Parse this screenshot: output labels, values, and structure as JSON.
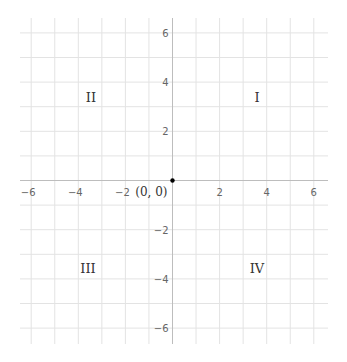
{
  "diagram": {
    "type": "cartesian-coordinate-plane",
    "x_range": [
      -6,
      6
    ],
    "y_range": [
      -6,
      6
    ],
    "grid_step": 1,
    "label_step": 2,
    "x_tick_labels": [
      "−6",
      "−4",
      "−2",
      "2",
      "4",
      "6"
    ],
    "x_tick_values": [
      -6,
      -4,
      -2,
      2,
      4,
      6
    ],
    "y_tick_labels": [
      "6",
      "4",
      "2",
      "−2",
      "−4",
      "−6"
    ],
    "y_tick_values": [
      6,
      4,
      2,
      -2,
      -4,
      -6
    ],
    "origin": {
      "label": "(0, 0)",
      "point": [
        0,
        0
      ]
    },
    "quadrants": [
      {
        "label": "I",
        "position": [
          3.5,
          3.5
        ]
      },
      {
        "label": "II",
        "position": [
          -3.5,
          3.5
        ]
      },
      {
        "label": "III",
        "position": [
          -3.5,
          -3.5
        ]
      },
      {
        "label": "IV",
        "position": [
          3.5,
          -3.5
        ]
      }
    ],
    "colors": {
      "grid": "#e3e3e3",
      "axis": "#bdbdbd",
      "tick_label": "#666666",
      "point": "#000000",
      "text": "#333333"
    }
  }
}
